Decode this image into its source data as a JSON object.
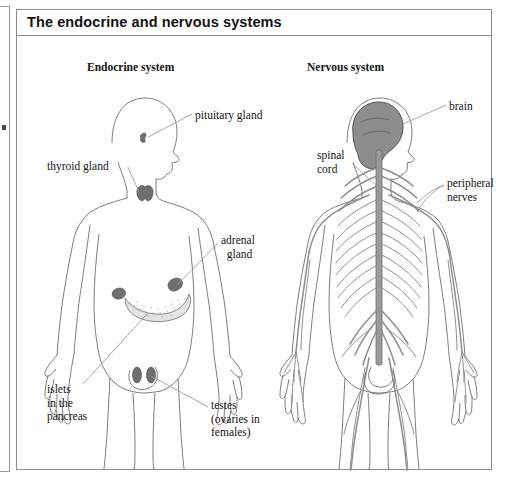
{
  "figure": {
    "title": "The endocrine and nervous systems",
    "headings": {
      "endocrine": "Endocrine system",
      "nervous": "Nervous system"
    },
    "endocrine_labels": [
      {
        "key": "pituitary",
        "text": "pituitary gland"
      },
      {
        "key": "thyroid",
        "text": "thyroid gland"
      },
      {
        "key": "adrenal",
        "text": "adrenal\n  gland"
      },
      {
        "key": "islets",
        "text": "islets\nin the\npancreas"
      },
      {
        "key": "testes",
        "text": "testes\n(ovaries in\nfemales)"
      }
    ],
    "nervous_labels": [
      {
        "key": "brain",
        "text": "brain"
      },
      {
        "key": "spinal_cord",
        "text": "spinal\ncord"
      },
      {
        "key": "peripheral_nerves",
        "text": "peripheral\nnerves"
      }
    ],
    "colors": {
      "panel_border": "#8d8d8d",
      "body_outline": "#6e6e6e",
      "leader_line": "#9b9b9b",
      "organ_fill": "#6f6f6f",
      "brain_fill": "#8d8d8d",
      "nerve_stroke": "#8e8e8e",
      "text": "#141414",
      "background": "#ffffff"
    }
  }
}
